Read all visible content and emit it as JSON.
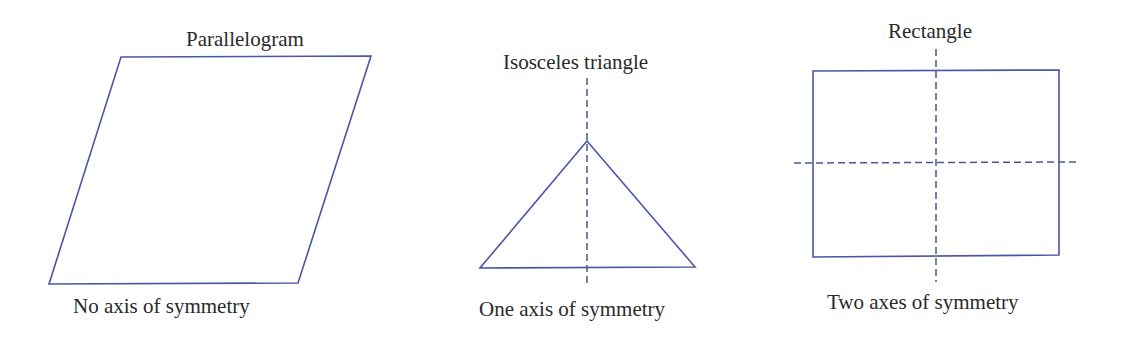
{
  "figure": {
    "panels": [
      {
        "id": "parallelogram",
        "title": "Parallelogram",
        "caption": "No axis of symmetry",
        "axes_of_symmetry": 0
      },
      {
        "id": "isosceles-triangle",
        "title": "Isosceles triangle",
        "caption": "One axis of symmetry",
        "axes_of_symmetry": 1
      },
      {
        "id": "rectangle",
        "title": "Rectangle",
        "caption": "Two axes of symmetry",
        "axes_of_symmetry": 2
      }
    ],
    "colors": {
      "shape_stroke": "#4b57a6",
      "axis_stroke": "#4b5690",
      "text": "#2a2a2a",
      "background": "#ffffff"
    }
  }
}
